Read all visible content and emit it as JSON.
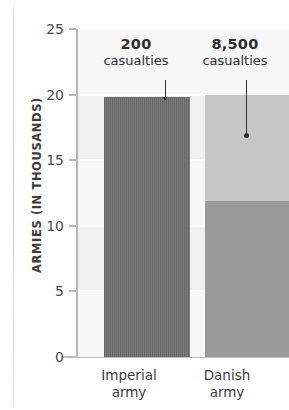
{
  "chart_data": {
    "type": "bar",
    "title": "",
    "subtitle": "",
    "xlabel": "",
    "ylabel": "ARMIES (IN THOUSANDS)",
    "ylim": [
      0,
      25
    ],
    "yticks": [
      0,
      5,
      10,
      15,
      20,
      25
    ],
    "ytick_labels": [
      "0",
      "5",
      "10",
      "15",
      "20",
      "25"
    ],
    "grid": true,
    "legend": "none",
    "categories": [
      "Imperial army",
      "Danish army"
    ],
    "category_lines": [
      [
        "Imperial",
        "army"
      ],
      [
        "Danish",
        "army"
      ]
    ],
    "series": [
      {
        "name": "Army strength (thousands)",
        "values": [
          19.8,
          20.0
        ]
      },
      {
        "name": "Survivors (thousands)",
        "values": [
          19.6,
          11.9
        ]
      }
    ],
    "bars": [
      {
        "category": "Imperial army",
        "total": 19.8,
        "survivors": 19.6,
        "casualties_value": 200,
        "casualties_label": "200",
        "casualties_caption": "casualties",
        "fill": "#6e6e6e",
        "texture": "vertical-stripes"
      },
      {
        "category": "Danish army",
        "total": 20.0,
        "survivors": 11.9,
        "casualties_value": 8500,
        "casualties_label": "8,500",
        "casualties_caption": "casualties",
        "fill_casualties": "#c6c6c6",
        "fill_survivors": "#9a9a9a"
      }
    ],
    "annotations": [
      {
        "target": "Imperial army",
        "value": "200",
        "caption": "casualties"
      },
      {
        "target": "Danish army",
        "value": "8,500",
        "caption": "casualties"
      }
    ],
    "colors": {
      "plot_background": "#f0f0f0",
      "band": "#f7f7f7",
      "gridline": "#ffffff",
      "axis": "#b7b7b7",
      "text": "#3b3b3b",
      "imperial_bar": "#6e6e6e",
      "danish_casualties": "#c6c6c6",
      "danish_survivors": "#9a9a9a"
    }
  }
}
